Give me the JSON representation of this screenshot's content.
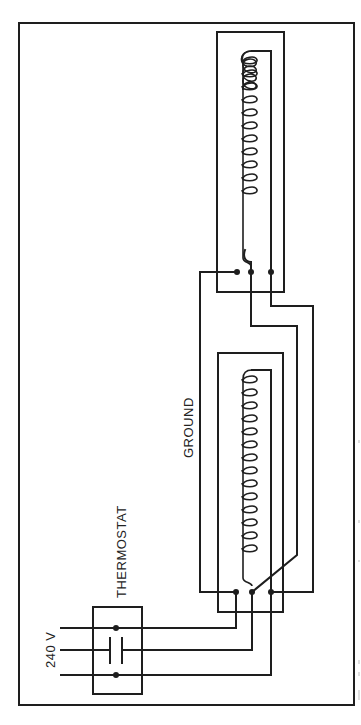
{
  "diagram": {
    "type": "wiring-schematic",
    "orientation": "rotated-90-ccw",
    "labels": {
      "voltage": "240 V",
      "thermostat": "THERMOSTAT",
      "ground": "GROUND"
    },
    "components": [
      {
        "id": "supply",
        "label": "240 V",
        "lines": 3
      },
      {
        "id": "thermostat",
        "label": "THERMOSTAT",
        "contains": "capacitor-symbol"
      },
      {
        "id": "heater-1",
        "type": "coil-element",
        "terminals": 3,
        "coil_turns": 11
      },
      {
        "id": "heater-2",
        "type": "coil-element",
        "terminals": 3,
        "coil_turns": 11
      }
    ],
    "colors": {
      "line": "#1e1e1e",
      "background": "#ffffff"
    }
  }
}
